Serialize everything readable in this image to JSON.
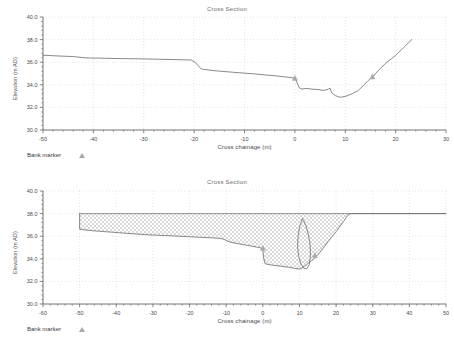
{
  "document": {
    "kind": "cross-section-profile-plots",
    "panel_count": 2
  },
  "legend": {
    "bank_marker_label": "Bank marker",
    "marker_icon": "triangle-marker-icon",
    "marker_color": "#a9a9a9"
  },
  "colors": {
    "background": "#ffffff",
    "line": "#6b6b6b",
    "grid": "#c9c9c9",
    "axis": "#555555",
    "text": "#4a4a4a",
    "fill_hatch": "#d8d8d8",
    "marker": "#a9a9a9"
  },
  "chart_data": [
    {
      "id": "top-cross-section",
      "type": "line",
      "title": "Cross Section",
      "xlabel": "Cross chainage (m)",
      "ylabel": "Elevation (m AD)",
      "xlim": [
        -50,
        30
      ],
      "ylim": [
        30.0,
        40.0
      ],
      "xticks": [
        -50,
        -40,
        -30,
        -20,
        -10,
        0,
        10,
        20,
        30
      ],
      "xtick_labels": [
        "-50",
        "-40",
        "-30",
        "-20",
        "-10",
        "0",
        "10",
        "20",
        "30"
      ],
      "yticks": [
        30.0,
        32.0,
        34.0,
        36.0,
        38.0,
        40.0
      ],
      "ytick_labels": [
        "30.0",
        "32.0",
        "34.0",
        "36.0",
        "38.0",
        "40.0"
      ],
      "grid": true,
      "minor_ticks": true,
      "legend_position": "below-left",
      "series": [
        {
          "name": "Ground profile",
          "x": [
            -50.0,
            -47.0,
            -44.0,
            -41.5,
            -39.0,
            -35.0,
            -31.0,
            -27.0,
            -23.0,
            -20.6,
            -19.8,
            -18.6,
            -16.0,
            -12.0,
            -8.0,
            -4.0,
            -1.2,
            -0.4,
            0.0,
            0.4,
            0.9,
            1.4,
            2.2,
            3.4,
            4.6,
            5.8,
            6.7,
            7.0,
            7.3,
            8.0,
            8.7,
            9.2,
            10.2,
            11.4,
            12.6,
            13.6,
            14.4,
            15.1,
            15.6,
            16.4,
            18.0,
            20.0,
            21.6,
            23.2
          ],
          "y": [
            36.62,
            36.55,
            36.5,
            36.38,
            36.36,
            36.32,
            36.3,
            36.26,
            36.22,
            36.2,
            36.0,
            35.4,
            35.25,
            35.1,
            34.96,
            34.8,
            34.66,
            34.62,
            34.6,
            34.2,
            33.72,
            33.62,
            33.68,
            33.62,
            33.58,
            33.5,
            33.62,
            33.7,
            33.3,
            33.05,
            32.93,
            32.9,
            33.0,
            33.22,
            33.5,
            33.95,
            34.3,
            34.6,
            34.76,
            35.2,
            35.9,
            36.6,
            37.3,
            38.0
          ]
        }
      ],
      "markers": [
        {
          "name": "left-bank-marker",
          "x": 0.0,
          "y": 34.6
        },
        {
          "name": "right-bank-marker",
          "x": 15.4,
          "y": 34.72
        }
      ]
    },
    {
      "id": "bottom-cross-section",
      "type": "area",
      "title": "Cross Section",
      "xlabel": "Cross chainage (m)",
      "ylabel": "Elevation (m AD)",
      "xlim": [
        -60,
        50
      ],
      "ylim": [
        30.0,
        40.0
      ],
      "xticks": [
        -60,
        -50,
        -40,
        -30,
        -20,
        -10,
        0,
        10,
        20,
        30,
        40,
        50
      ],
      "xtick_labels": [
        "-60",
        "-50",
        "-40",
        "-30",
        "-20",
        "-10",
        "0",
        "10",
        "20",
        "30",
        "40",
        "50"
      ],
      "yticks": [
        30.0,
        32.0,
        34.0,
        36.0,
        38.0,
        40.0
      ],
      "ytick_labels": [
        "30.0",
        "32.0",
        "34.0",
        "36.0",
        "38.0",
        "40.0"
      ],
      "grid": true,
      "minor_ticks": true,
      "legend_position": "below-left",
      "fill_pattern": "checkerboard-hatch",
      "fill_top_level": 38.0,
      "series": [
        {
          "name": "Ground profile",
          "x": [
            -50.0,
            -50.0,
            -47.0,
            -43.0,
            -39.0,
            -35.0,
            -31.0,
            -27.0,
            -23.0,
            -20.0,
            -17.0,
            -14.0,
            -11.5,
            -10.6,
            -9.2,
            -7.0,
            -5.0,
            -3.0,
            -1.4,
            -0.6,
            -0.2,
            0.0,
            0.2,
            0.6,
            1.4,
            3.0,
            5.0,
            7.0,
            8.6,
            9.6,
            10.4,
            11.2,
            12.0,
            12.8,
            13.4,
            14.0,
            14.6,
            15.2,
            16.4,
            18.0,
            20.0,
            22.0,
            23.2,
            24.0,
            26.0,
            30.0,
            36.0,
            42.0,
            50.0
          ],
          "y": [
            38.0,
            36.62,
            36.5,
            36.4,
            36.3,
            36.2,
            36.12,
            36.06,
            36.0,
            35.95,
            35.9,
            35.86,
            35.8,
            35.72,
            35.5,
            35.35,
            35.24,
            35.12,
            35.02,
            34.96,
            34.9,
            34.85,
            34.1,
            33.58,
            33.5,
            33.42,
            33.34,
            33.26,
            33.16,
            33.1,
            33.12,
            33.3,
            33.5,
            33.7,
            33.86,
            34.0,
            34.2,
            34.42,
            34.9,
            35.6,
            36.4,
            37.3,
            37.85,
            38.0,
            38.0,
            38.0,
            38.0,
            38.0,
            38.0
          ]
        },
        {
          "name": "Bank lens outline",
          "x": [
            10.8,
            10.0,
            9.6,
            9.5,
            9.8,
            10.4,
            11.2,
            12.0,
            12.7,
            13.0,
            12.9,
            12.4,
            11.8,
            11.2,
            10.8
          ],
          "y": [
            37.55,
            36.8,
            35.9,
            35.0,
            34.2,
            33.55,
            33.15,
            33.12,
            33.5,
            34.3,
            35.3,
            36.2,
            36.9,
            37.35,
            37.55
          ]
        }
      ],
      "markers": [
        {
          "name": "left-bank-marker",
          "x": 0.0,
          "y": 34.95
        },
        {
          "name": "right-bank-marker",
          "x": 14.2,
          "y": 34.3
        }
      ]
    }
  ]
}
